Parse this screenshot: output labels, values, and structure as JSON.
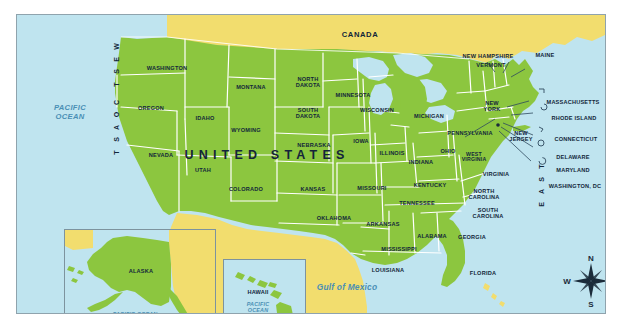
{
  "map": {
    "title_overlay": "UNITED STATES",
    "neighbors": {
      "north": "CANADA",
      "south": "MEXICO"
    },
    "water_bodies": [
      {
        "name": "PACIFIC OCEAN",
        "line1": "PACIFIC",
        "line2": "OCEAN"
      },
      {
        "name": "Gulf of Mexico",
        "line1": "Gulf of Mexico"
      }
    ],
    "gulf_label": "Gulf of Mexico",
    "pacific_line1": "PACIFIC",
    "pacific_line2": "OCEAN",
    "coasts": {
      "west": "WEST COAST",
      "east": "EAST COAST",
      "west_letters": [
        "W",
        "E",
        "S",
        "T",
        "",
        "C",
        "O",
        "A",
        "S",
        "T"
      ],
      "east_letters": [
        "T",
        "S",
        "A",
        "O",
        "C",
        "",
        "T",
        "S",
        "A",
        "E"
      ]
    },
    "states": [
      {
        "id": "washington",
        "label": "WASHINGTON"
      },
      {
        "id": "oregon",
        "label": "OREGON"
      },
      {
        "id": "idaho",
        "label": "IDAHO"
      },
      {
        "id": "montana",
        "label": "MONTANA"
      },
      {
        "id": "north-dakota",
        "label": "NORTH DAKOTA"
      },
      {
        "id": "south-dakota",
        "label": "SOUTH DAKOTA"
      },
      {
        "id": "minnesota",
        "label": "MINNESOTA"
      },
      {
        "id": "wisconsin",
        "label": "WISCONSIN"
      },
      {
        "id": "michigan",
        "label": "MICHIGAN"
      },
      {
        "id": "wyoming",
        "label": "WYOMING"
      },
      {
        "id": "nebraska",
        "label": "NEBRASKA"
      },
      {
        "id": "iowa",
        "label": "IOWA"
      },
      {
        "id": "illinois",
        "label": "ILLINOIS"
      },
      {
        "id": "indiana",
        "label": "INDIANA"
      },
      {
        "id": "ohio",
        "label": "OHIO"
      },
      {
        "id": "pennsylvania",
        "label": "PENNSYLVANIA"
      },
      {
        "id": "new-york",
        "label": "NEW YORK"
      },
      {
        "id": "new-hampshire",
        "label": "NEW HAMPSHIRE"
      },
      {
        "id": "vermont",
        "label": "VERMONT"
      },
      {
        "id": "maine",
        "label": "MAINE"
      },
      {
        "id": "massachusetts",
        "label": "MASSACHUSETTS"
      },
      {
        "id": "rhode-island",
        "label": "RHODE ISLAND"
      },
      {
        "id": "connecticut",
        "label": "CONNECTICUT"
      },
      {
        "id": "new-jersey",
        "label": "NEW JERSEY"
      },
      {
        "id": "delaware",
        "label": "DELAWARE"
      },
      {
        "id": "maryland",
        "label": "MARYLAND"
      },
      {
        "id": "washington-dc",
        "label": "WASHINGTON, DC"
      },
      {
        "id": "west-virginia",
        "label": "WEST VIRGINIA"
      },
      {
        "id": "virginia",
        "label": "VIRGINIA"
      },
      {
        "id": "nevada",
        "label": "NEVADA"
      },
      {
        "id": "utah",
        "label": "UTAH"
      },
      {
        "id": "colorado",
        "label": "COLORADO"
      },
      {
        "id": "kansas",
        "label": "KANSAS"
      },
      {
        "id": "missouri",
        "label": "MISSOURI"
      },
      {
        "id": "kentucky",
        "label": "KENTUCKY"
      },
      {
        "id": "tennessee",
        "label": "TENNESSEE"
      },
      {
        "id": "north-carolina",
        "label": "NORTH CAROLINA"
      },
      {
        "id": "south-carolina",
        "label": "SOUTH CAROLINA"
      },
      {
        "id": "oklahoma",
        "label": "OKLAHOMA"
      },
      {
        "id": "arkansas",
        "label": "ARKANSAS"
      },
      {
        "id": "alabama",
        "label": "ALABAMA"
      },
      {
        "id": "georgia",
        "label": "GEORGIA"
      },
      {
        "id": "mississippi",
        "label": "MISSISSIPPI"
      },
      {
        "id": "louisiana",
        "label": "LOUISIANA"
      },
      {
        "id": "florida",
        "label": "FLORIDA"
      },
      {
        "id": "alaska",
        "label": "ALASKA"
      },
      {
        "id": "hawaii",
        "label": "HAWAII"
      }
    ],
    "state_labels": {
      "washington": "WASHINGTON",
      "oregon": "OREGON",
      "idaho": "IDAHO",
      "montana": "MONTANA",
      "north_dakota_l1": "NORTH",
      "north_dakota_l2": "DAKOTA",
      "south_dakota_l1": "SOUTH",
      "south_dakota_l2": "DAKOTA",
      "minnesota": "MINNESOTA",
      "wisconsin": "WISCONSIN",
      "michigan": "MICHIGAN",
      "wyoming": "WYOMING",
      "nebraska": "NEBRASKA",
      "iowa": "IOWA",
      "illinois": "ILLINOIS",
      "indiana": "INDIANA",
      "ohio": "OHIO",
      "pennsylvania": "PENNSYLVANIA",
      "new_york_l1": "NEW",
      "new_york_l2": "YORK",
      "new_hampshire": "NEW HAMPSHIRE",
      "vermont": "VERMONT",
      "maine": "MAINE",
      "massachusetts": "MASSACHUSETTS",
      "rhode_island": "RHODE ISLAND",
      "connecticut": "CONNECTICUT",
      "new_jersey_l1": "NEW",
      "new_jersey_l2": "JERSEY",
      "delaware": "DELAWARE",
      "maryland": "MARYLAND",
      "washington_dc": "WASHINGTON, DC",
      "west_virginia_l1": "WEST",
      "west_virginia_l2": "VIRGINIA",
      "virginia": "VIRGINIA",
      "nevada": "NEVADA",
      "utah": "UTAH",
      "colorado": "COLORADO",
      "kansas": "KANSAS",
      "missouri": "MISSOURI",
      "kentucky": "KENTUCKY",
      "tennessee": "TENNESSEE",
      "north_carolina_l1": "NORTH",
      "north_carolina_l2": "CAROLINA",
      "south_carolina_l1": "SOUTH",
      "south_carolina_l2": "CAROLINA",
      "oklahoma": "OKLAHOMA",
      "arkansas": "ARKANSAS",
      "alabama": "ALABAMA",
      "georgia": "GEORGIA",
      "mississippi": "MISSISSIPPI",
      "louisiana": "LOUISIANA",
      "florida": "FLORIDA"
    },
    "insets": [
      {
        "id": "alaska-inset",
        "title": "ALASKA",
        "ocean": "PACIFIC OCEAN"
      },
      {
        "id": "hawaii-inset",
        "title": "HAWAII",
        "ocean_l1": "PACIFIC",
        "ocean_l2": "OCEAN"
      }
    ],
    "inset_text": {
      "alaska": "ALASKA",
      "alaska_ocean": "PACIFIC OCEAN",
      "hawaii": "HAWAII",
      "hawaii_ocean_l1": "PACIFIC",
      "hawaii_ocean_l2": "OCEAN"
    },
    "compass": {
      "north": "N",
      "east": "E",
      "south": "S",
      "west": "W"
    },
    "colors": {
      "land_usa": "#8cc63f",
      "land_neighbor": "#f2dd6e",
      "ocean": "#bfe4ef",
      "border_line": "#ffffff",
      "frame": "#8fa3ad",
      "label_text": "#12263a",
      "ocean_text": "#4a8fb5"
    }
  }
}
